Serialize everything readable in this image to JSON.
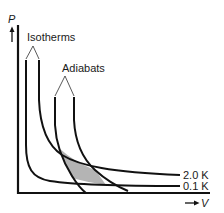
{
  "diagram": {
    "title": "",
    "axes": {
      "y_label": "P",
      "x_label": "V"
    },
    "groups": {
      "isotherms_label": "Isotherms",
      "adiabats_label": "Adiabats"
    },
    "curve_labels": {
      "upper_isotherm": "2.0 K",
      "lower_isotherm": "0.1 K"
    },
    "colors": {
      "line": "#111111",
      "shade": "#b4b4b4",
      "background": "#ffffff"
    },
    "shaded_region": "Carnot cycle area bounded by the 2.0 K and 0.1 K isotherms and two adiabats"
  }
}
